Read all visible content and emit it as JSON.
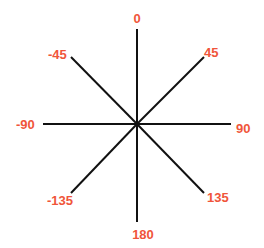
{
  "diagram": {
    "title": "",
    "label_color": "#f0553a",
    "line_color": "#111111",
    "center": [
      137,
      124
    ],
    "directions": [
      {
        "label": "0",
        "angle": 0
      },
      {
        "label": "45",
        "angle": 45
      },
      {
        "label": "90",
        "angle": 90
      },
      {
        "label": "135",
        "angle": 135
      },
      {
        "label": "180",
        "angle": 180
      },
      {
        "label": "-135",
        "angle": -135
      },
      {
        "label": "-90",
        "angle": -90
      },
      {
        "label": "-45",
        "angle": -45
      }
    ]
  }
}
